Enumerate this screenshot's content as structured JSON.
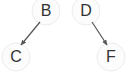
{
  "diagram": {
    "background_color": "#ffffff",
    "node_fill_color": "#fcfcfc",
    "node_stroke_color": "#ececec",
    "edge_color": "#555555",
    "label_color": "#333333",
    "nodes": [
      {
        "id": "B",
        "label": "B",
        "cx": 46,
        "cy": 11,
        "r": 14,
        "label_x": 36,
        "label_y": 3
      },
      {
        "id": "D",
        "label": "D",
        "cx": 86,
        "cy": 11,
        "r": 14,
        "label_x": 76,
        "label_y": 3
      },
      {
        "id": "C",
        "label": "C",
        "cx": 16,
        "cy": 57,
        "r": 14,
        "label_x": 6,
        "label_y": 49
      },
      {
        "id": "F",
        "label": "F",
        "cx": 111,
        "cy": 57,
        "r": 14,
        "label_x": 101,
        "label_y": 49
      }
    ],
    "edges": [
      {
        "id": "B-C",
        "from": "B",
        "to": "C",
        "directed": true,
        "x1": 40,
        "y1": 22,
        "x2": 21,
        "y2": 45
      },
      {
        "id": "D-F",
        "from": "D",
        "to": "F",
        "directed": true,
        "x1": 92,
        "y1": 22,
        "x2": 107,
        "y2": 45
      }
    ]
  }
}
